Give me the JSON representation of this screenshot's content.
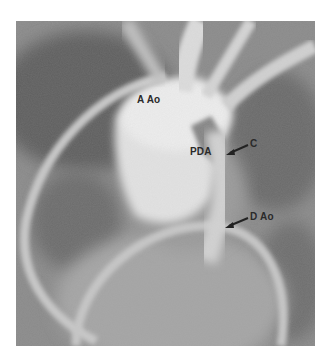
{
  "figure": {
    "type": "angiogram",
    "labels": {
      "ascending_aorta": "A Ao",
      "pda": "PDA",
      "c": "C",
      "descending_aorta": "D Ao"
    }
  }
}
